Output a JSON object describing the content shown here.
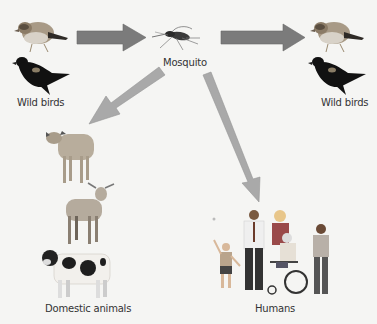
{
  "diagram": {
    "nodes": {
      "wild_birds_left": {
        "label": "Wild birds"
      },
      "mosquito": {
        "label": "Mosquito"
      },
      "wild_birds_right": {
        "label": "Wild birds"
      },
      "domestic_animals": {
        "label": "Domestic animals"
      },
      "humans": {
        "label": "Humans"
      }
    },
    "edges": [
      {
        "from": "wild_birds_left",
        "to": "mosquito",
        "style": "dark"
      },
      {
        "from": "mosquito",
        "to": "wild_birds_right",
        "style": "dark"
      },
      {
        "from": "mosquito",
        "to": "domestic_animals",
        "style": "light"
      },
      {
        "from": "mosquito",
        "to": "humans",
        "style": "light"
      }
    ],
    "colors": {
      "background": "#f5f5f3",
      "arrow_dark": "#7b7b7b",
      "arrow_light": "#a9a9a9",
      "text": "#333333"
    }
  }
}
